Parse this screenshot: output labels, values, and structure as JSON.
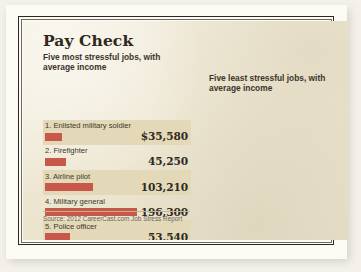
{
  "title": "Pay Check",
  "columns": [
    {
      "id": "most-stressful",
      "subtitle": "Five most stressful jobs,\nwith average income",
      "bar_color": "#c8584a",
      "rows": [
        {
          "rank": "1.",
          "label": "1. Enlisted military soldier",
          "value": 35580,
          "value_text": "$35,580"
        },
        {
          "rank": "2.",
          "label": "2. Firefighter",
          "value": 45250,
          "value_text": "45,250"
        },
        {
          "rank": "3.",
          "label": "3. Airline pilot",
          "value": 103210,
          "value_text": "103,210"
        },
        {
          "rank": "4.",
          "label": "4. Military general",
          "value": 196300,
          "value_text": "196,300"
        },
        {
          "rank": "5.",
          "label": "5. Police officer",
          "value": 53540,
          "value_text": "53,540"
        }
      ]
    },
    {
      "id": "least-stressful",
      "subtitle": "Five least stressful jobs,\nwith average income",
      "bar_color": "#6f86a8",
      "rows": [
        {
          "rank": "1.",
          "label": "1. Medical-records technician",
          "value": 32350,
          "value_text": "$32,350"
        },
        {
          "rank": "2.",
          "label": "2. Jeweler",
          "value": 35170,
          "value_text": "35,170"
        },
        {
          "rank": "3.",
          "label": "3. Hairstylist",
          "value": 22760,
          "value_text": "22,760"
        },
        {
          "rank": "4.",
          "label": "4. Dressmaker/tailor",
          "value": 26560,
          "value_text": "26,560"
        },
        {
          "rank": "5.",
          "label": "5. Medical-laboratory technician",
          "value": 36280,
          "value_text": "36,280"
        }
      ]
    }
  ],
  "source": "Source: 2012 CareerCast.com Job Stress Report",
  "chart_data": {
    "type": "bar",
    "title": "Pay Check",
    "xlabel": "",
    "ylabel": "Average income (US$)",
    "orientation": "horizontal",
    "grid": false,
    "legend_position": "none",
    "value_scale_max": 196300,
    "bar_pixel_max": 92,
    "series": [
      {
        "name": "Five most stressful jobs, with average income",
        "color": "#c8584a",
        "categories": [
          "Enlisted military soldier",
          "Firefighter",
          "Airline pilot",
          "Military general",
          "Police officer"
        ],
        "values": [
          35580,
          45250,
          103210,
          196300,
          53540
        ],
        "value_labels": [
          "$35,580",
          "45,250",
          "103,210",
          "196,300",
          "53,540"
        ]
      },
      {
        "name": "Five least stressful jobs, with average income",
        "color": "#6f86a8",
        "categories": [
          "Medical-records technician",
          "Jeweler",
          "Hairstylist",
          "Dressmaker/tailor",
          "Medical-laboratory technician"
        ],
        "values": [
          32350,
          35170,
          22760,
          26560,
          36280
        ],
        "value_labels": [
          "$32,350",
          "35,170",
          "22,760",
          "26,560",
          "36,280"
        ]
      }
    ],
    "annotations": [
      "Source: 2012 CareerCast.com Job Stress Report"
    ]
  }
}
